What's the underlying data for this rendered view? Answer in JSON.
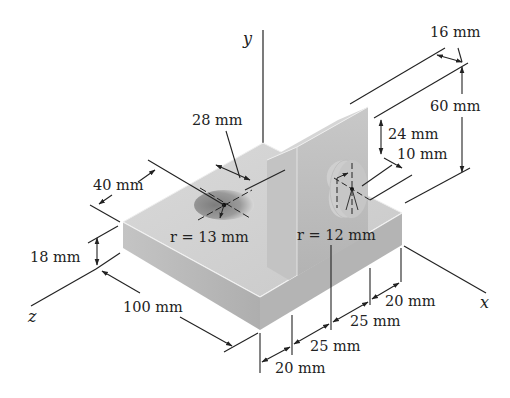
{
  "figure": {
    "type": "isometric engineering drawing"
  },
  "axes": {
    "x": "x",
    "y": "y",
    "z": "z"
  },
  "dimensions": {
    "upright_thickness": "16 mm",
    "upright_height": "60 mm",
    "boss_height_from_top": "24 mm",
    "boss_length": "10 mm",
    "hole_offset": "28 mm",
    "hole_edge_offset": "40 mm",
    "base_thickness": "18 mm",
    "base_length": "100 mm",
    "hole_radius": "r = 13 mm",
    "boss_radius": "r = 12 mm",
    "x_seg_1": "20 mm",
    "x_seg_2": "25 mm",
    "x_seg_3": "25 mm",
    "x_seg_4": "20 mm"
  },
  "colors": {
    "top_face": "#d4d4d4",
    "front_face": "#bdbdbd",
    "side_face": "#a9a9a9",
    "hole_shade": "#8f8f8f",
    "line": "#222222"
  }
}
